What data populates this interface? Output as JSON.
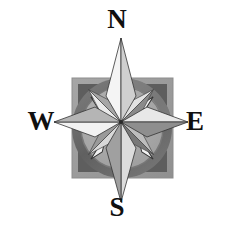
{
  "figure": {
    "name": "compass-rose",
    "background_color": "#ffffff",
    "width": 234,
    "height": 233
  },
  "labels": {
    "north": "N",
    "south": "S",
    "west": "W",
    "east": "E",
    "text_color": "#101010"
  },
  "plate": {
    "name": "square-plate",
    "fill": "#9a9a9a",
    "stroke": "#8a8a8a",
    "x": 72,
    "y": 78,
    "width": 101,
    "height": 100,
    "corner_fill": "#5e5e5e",
    "corner_size": 22
  },
  "ring": {
    "name": "outer-ring",
    "outer_fill": "#6d6d6d",
    "outer_radius": 50,
    "inner_fill": "#a8a8a8",
    "inner_radius": 41,
    "highlight_fill": "#b8b8b8",
    "center_x": 122,
    "center_y": 128
  },
  "star": {
    "name": "eight-point-star",
    "center_x": 121,
    "center_y": 122,
    "major_radius": 84,
    "minor_radius": 46,
    "waist": 15,
    "light_fill": "#f0f0f0",
    "mid_fill": "#d2d2d2",
    "dark_fill": "#7f7f7f",
    "shadow_fill": "#9c9c9c",
    "outline": "#2a2a2a"
  },
  "needles": {
    "name": "intercardinal-needles",
    "fill": "#f2f2f2",
    "stroke": "#333333",
    "count": 4,
    "angles_deg": [
      45,
      135,
      225,
      315
    ]
  }
}
